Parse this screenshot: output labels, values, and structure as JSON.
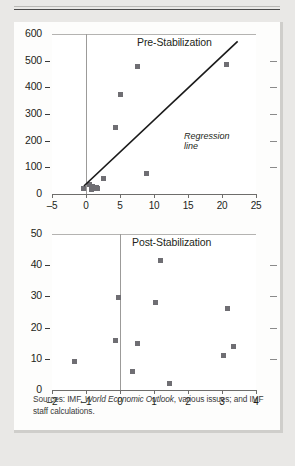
{
  "figure": {
    "source_note_prefix": "Sources: IMF, ",
    "source_note_italic": "World Economic Outlook",
    "source_note_suffix": ", various issues; and IMF staff calculations.",
    "marker_color": "#6f6e73",
    "text_color": "#231f20",
    "grid_color": "#b4b3b1",
    "axis_color": "#6e6d6b",
    "regression_line_color": "#1a1a1a",
    "panel_background": "#ffffff",
    "page_background": "#e9e8e6"
  },
  "chart_data": [
    {
      "type": "scatter",
      "title": "Pre-Stabilization",
      "xlabel": "",
      "ylabel": "",
      "xlim": [
        -5,
        25
      ],
      "ylim": [
        0,
        600
      ],
      "xticks": [
        -5,
        0,
        5,
        10,
        15,
        20,
        25
      ],
      "yticks": [
        0,
        100,
        200,
        300,
        400,
        500,
        600
      ],
      "xtick_labels": [
        "-5",
        "0",
        "5",
        "10",
        "15",
        "20",
        "25"
      ],
      "ytick_labels": [
        "0",
        "100",
        "200",
        "300",
        "400",
        "500",
        "600"
      ],
      "grid": true,
      "legend": "none",
      "annotations": [
        {
          "text_line1": "Regression",
          "text_line2": "line",
          "x": 11.5,
          "y": 250
        }
      ],
      "series": [
        {
          "name": "Pre-Stabilization observations",
          "points": [
            {
              "x": -0.4,
              "y": 22
            },
            {
              "x": 0.5,
              "y": 35
            },
            {
              "x": 0.8,
              "y": 18
            },
            {
              "x": 1.0,
              "y": 30
            },
            {
              "x": 1.2,
              "y": 20
            },
            {
              "x": 1.5,
              "y": 24
            },
            {
              "x": 1.7,
              "y": 22
            },
            {
              "x": 2.6,
              "y": 58
            },
            {
              "x": 4.3,
              "y": 248
            },
            {
              "x": 5.1,
              "y": 375
            },
            {
              "x": 7.5,
              "y": 478
            },
            {
              "x": 8.9,
              "y": 78
            },
            {
              "x": 20.6,
              "y": 485
            }
          ]
        }
      ],
      "regression_line": {
        "x1": -0.3,
        "y1": 30,
        "x2": 22.3,
        "y2": 572
      }
    },
    {
      "type": "scatter",
      "title": "Post-Stabilization",
      "xlabel": "",
      "ylabel": "",
      "xlim": [
        -2,
        4
      ],
      "ylim": [
        0,
        50
      ],
      "xticks": [
        -2,
        -1,
        0,
        1,
        2,
        3,
        4
      ],
      "yticks": [
        0,
        10,
        20,
        30,
        40,
        50
      ],
      "xtick_labels": [
        "-2",
        "-1",
        "0",
        "1",
        "2",
        "3",
        "4"
      ],
      "ytick_labels": [
        "0",
        "10",
        "20",
        "30",
        "40",
        "50"
      ],
      "grid": true,
      "legend": "none",
      "annotations": [],
      "series": [
        {
          "name": "Post-Stabilization observations",
          "points": [
            {
              "x": -1.35,
              "y": 9
            },
            {
              "x": -0.12,
              "y": 16
            },
            {
              "x": -0.05,
              "y": 29.5
            },
            {
              "x": 0.38,
              "y": 6
            },
            {
              "x": 0.5,
              "y": 15
            },
            {
              "x": 1.05,
              "y": 28
            },
            {
              "x": 1.2,
              "y": 41.5
            },
            {
              "x": 1.45,
              "y": 2
            },
            {
              "x": 3.05,
              "y": 11
            },
            {
              "x": 3.15,
              "y": 26
            },
            {
              "x": 3.35,
              "y": 14
            }
          ]
        }
      ],
      "regression_line": null
    }
  ]
}
